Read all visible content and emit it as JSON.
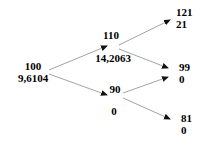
{
  "figure": {
    "type": "binomial-tree",
    "title": "",
    "line_color": "#999999",
    "text_color": "#000000",
    "background": "#ffffff",
    "decimal_separator": ","
  },
  "nodes": [
    {
      "id": "root",
      "name": "node-root",
      "price": "100",
      "value": "9,6104",
      "x": 33,
      "y": 66,
      "align": "center"
    },
    {
      "id": "up",
      "name": "node-up",
      "price": "110",
      "value": "14,2063",
      "x": 111,
      "y": 30,
      "align": "center"
    },
    {
      "id": "down",
      "name": "node-down",
      "price": "90",
      "value": "0",
      "x": 113,
      "y": 94,
      "align": "center"
    },
    {
      "id": "up-up",
      "name": "node-up-up",
      "price": "121",
      "value": "21",
      "x": 177,
      "y": 6,
      "align": "left"
    },
    {
      "id": "up-down",
      "name": "node-up-down",
      "price": "99",
      "value": "0",
      "x": 180,
      "y": 60,
      "align": "left"
    },
    {
      "id": "down-down",
      "name": "node-down-down",
      "price": "81",
      "value": "0",
      "x": 182,
      "y": 112,
      "align": "left"
    }
  ],
  "edges": [
    {
      "name": "edge-root-up",
      "from": "root",
      "to": "up",
      "x1": 49,
      "y1": 70,
      "x2": 107,
      "y2": 46
    },
    {
      "name": "edge-root-down",
      "from": "root",
      "to": "down",
      "x1": 49,
      "y1": 74,
      "x2": 107,
      "y2": 95
    },
    {
      "name": "edge-up-upup",
      "from": "up",
      "to": "up-up",
      "x1": 119,
      "y1": 45,
      "x2": 170,
      "y2": 20
    },
    {
      "name": "edge-up-updown",
      "from": "up",
      "to": "up-down",
      "x1": 119,
      "y1": 49,
      "x2": 168,
      "y2": 68
    },
    {
      "name": "edge-down-updown",
      "from": "down",
      "to": "up-down",
      "x1": 123,
      "y1": 93,
      "x2": 168,
      "y2": 77
    },
    {
      "name": "edge-down-downdown",
      "from": "down",
      "to": "down-down",
      "x1": 123,
      "y1": 98,
      "x2": 170,
      "y2": 119
    }
  ],
  "chart_data": {
    "type": "diagram",
    "subtype": "binomial-lattice",
    "title": "",
    "steps": 2,
    "underlying_prices": {
      "step_0": [
        "100"
      ],
      "step_1": [
        "110",
        "90"
      ],
      "step_2": [
        "121",
        "99",
        "81"
      ]
    },
    "option_values": {
      "step_0": [
        "9,6104"
      ],
      "step_1": [
        "14,2063",
        "0"
      ],
      "step_2": [
        "21",
        "0",
        "0"
      ]
    },
    "up_factor": 1.1,
    "down_factor": 0.9,
    "recombining": true
  }
}
